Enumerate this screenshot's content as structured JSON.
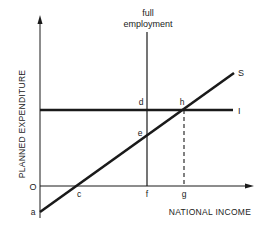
{
  "diagram": {
    "type": "keynesian-cross-savings-investment",
    "axes": {
      "y_label": "PLANNED EXPENDITURE",
      "x_label": "NATIONAL INCOME",
      "origin_label": "O"
    },
    "annotation": {
      "line1": "full",
      "line2": "employment"
    },
    "lines": {
      "savings_label": "S",
      "investment_label": "I"
    },
    "points": {
      "a": "a",
      "c": "c",
      "d": "d",
      "e": "e",
      "f": "f",
      "g": "g",
      "h": "h"
    },
    "colors": {
      "ink": "#1a1a1a",
      "background": "#ffffff"
    }
  }
}
